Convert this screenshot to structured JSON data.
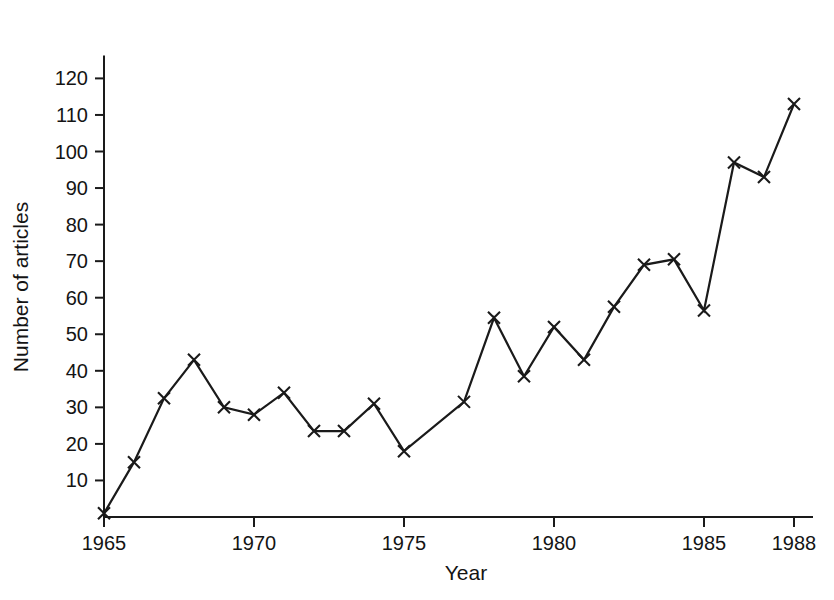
{
  "chart_data": {
    "type": "line",
    "title": "",
    "xlabel": "Year",
    "ylabel": "Number of articles",
    "xlim": [
      1964.2,
      1988.6
    ],
    "ylim": [
      0,
      126
    ],
    "grid": false,
    "legend": null,
    "marker": "x",
    "line_color": "#1a1a1a",
    "x": [
      1965,
      1966,
      1967,
      1968,
      1969,
      1970,
      1971,
      1972,
      1973,
      1974,
      1975,
      1977,
      1978,
      1979,
      1980,
      1981,
      1982,
      1983,
      1984,
      1985,
      1986,
      1987,
      1988
    ],
    "values": [
      1,
      15,
      32.5,
      43,
      30,
      28,
      34,
      23.5,
      23.5,
      31,
      18,
      31.5,
      54.5,
      38.5,
      52,
      43,
      57.5,
      69,
      70.5,
      56.5,
      97,
      93,
      113
    ],
    "x_ticks": [
      1965,
      1970,
      1975,
      1980,
      1985,
      1988
    ],
    "x_tick_labels": [
      "1965",
      "1970",
      "1975",
      "1980",
      "1985",
      "1988"
    ],
    "y_ticks": [
      10,
      20,
      30,
      40,
      50,
      60,
      70,
      80,
      90,
      100,
      110,
      120
    ],
    "y_tick_labels": [
      "10",
      "20",
      "30",
      "40",
      "50",
      "60",
      "70",
      "80",
      "90",
      "100",
      "110",
      "120"
    ]
  }
}
